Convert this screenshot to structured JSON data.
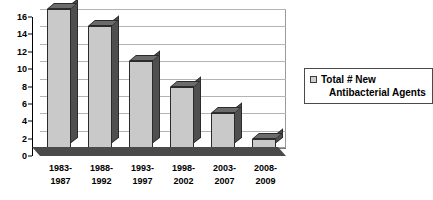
{
  "chart_data": {
    "type": "bar",
    "title": "",
    "xlabel": "",
    "ylabel": "",
    "categories": [
      "1983-1987",
      "1988-1992",
      "1993-1997",
      "1998-2002",
      "2003-2007",
      "2008-2009"
    ],
    "category_lines": [
      [
        "1983-",
        "1987"
      ],
      [
        "1988-",
        "1992"
      ],
      [
        "1993-",
        "1997"
      ],
      [
        "1998-",
        "2002"
      ],
      [
        "2003-",
        "2007"
      ],
      [
        "2008-",
        "2009"
      ]
    ],
    "values": [
      16,
      14,
      10,
      7,
      4,
      1
    ],
    "series": [
      {
        "name": "Total # New Antibacterial Agents",
        "values": [
          16,
          14,
          10,
          7,
          4,
          1
        ]
      }
    ],
    "ylim": [
      0,
      16
    ],
    "ytick_values": [
      0,
      2,
      4,
      6,
      8,
      10,
      12,
      14,
      16
    ],
    "ytick_labels": [
      "0",
      "2",
      "4",
      "6",
      "8",
      "10",
      "12",
      "14",
      "16"
    ],
    "grid": true,
    "legend_position": "right",
    "style": "excel-3d-clustered-column",
    "colors": {
      "bar_face": "#c9c9c9",
      "bar_top": "#6b6b6b",
      "bar_side": "#4f4f4f",
      "bar_outline": "#2b2b2b",
      "gridline": "#b4b4b4",
      "axis": "#000000",
      "plot_background": "#ffffff",
      "floor": "#4a4a4a"
    }
  },
  "legend": {
    "swatch_name": "legend-swatch",
    "label_line1": "Total # New",
    "label_line2": "Antibacterial Agents",
    "label_full": "Total # New Antibacterial Agents"
  }
}
